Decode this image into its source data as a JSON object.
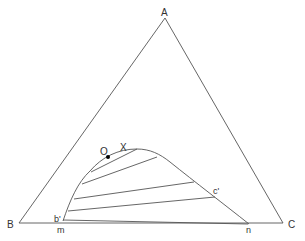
{
  "diagram": {
    "vertices": {
      "top": "A",
      "bottom_left": "B",
      "bottom_right": "C"
    },
    "points": {
      "plait_point": "X",
      "mixture_point": "O",
      "raffinate_end": "b'",
      "extract_end": "c'",
      "base_left": "m",
      "base_right": "n"
    },
    "tie_line_count": 6,
    "colors": {
      "line": "#555555",
      "text": "#333333",
      "point": "#000000"
    }
  }
}
